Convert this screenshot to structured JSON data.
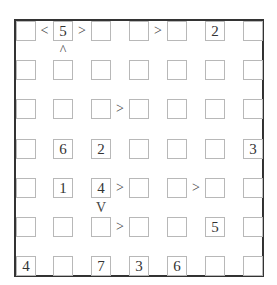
{
  "puzzle": {
    "type": "futoshiki",
    "size": 7,
    "grid": [
      [
        "",
        "5",
        "",
        "",
        "",
        "2",
        ""
      ],
      [
        "",
        "",
        "",
        "",
        "",
        "",
        ""
      ],
      [
        "",
        "",
        "",
        "",
        "",
        "",
        ""
      ],
      [
        "",
        "6",
        "2",
        "",
        "",
        "",
        "3"
      ],
      [
        "",
        "1",
        "4",
        "",
        "",
        "",
        ""
      ],
      [
        "",
        "",
        "",
        "",
        "",
        "5",
        ""
      ],
      [
        "4",
        "",
        "7",
        "3",
        "6",
        "",
        ""
      ]
    ],
    "horizontal_constraints": [
      {
        "row": 0,
        "between_cols": [
          0,
          1
        ],
        "symbol": "<"
      },
      {
        "row": 0,
        "between_cols": [
          1,
          2
        ],
        "symbol": ">"
      },
      {
        "row": 0,
        "between_cols": [
          3,
          4
        ],
        "symbol": ">"
      },
      {
        "row": 2,
        "between_cols": [
          2,
          3
        ],
        "symbol": ">"
      },
      {
        "row": 4,
        "between_cols": [
          2,
          3
        ],
        "symbol": ">"
      },
      {
        "row": 4,
        "between_cols": [
          4,
          5
        ],
        "symbol": ">"
      },
      {
        "row": 5,
        "between_cols": [
          2,
          3
        ],
        "symbol": ">"
      }
    ],
    "vertical_constraints": [
      {
        "col": 1,
        "between_rows": [
          0,
          1
        ],
        "symbol": "^"
      },
      {
        "col": 2,
        "between_rows": [
          4,
          5
        ],
        "symbol": "V"
      }
    ]
  }
}
